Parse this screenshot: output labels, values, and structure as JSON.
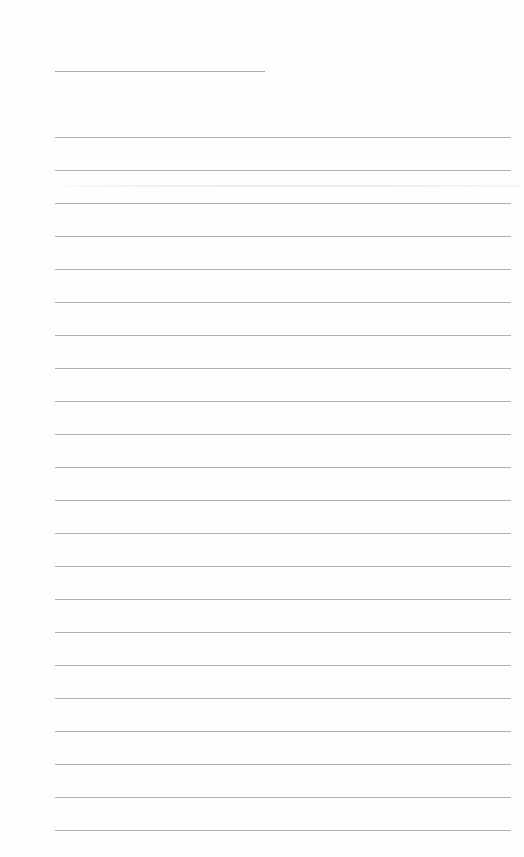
{
  "document": {
    "type": "blank ruled sheet",
    "title_line": {
      "x": 55,
      "y": 71,
      "width": 210
    },
    "ruled_lines": {
      "count": 22,
      "start_y": 137,
      "spacing": 33,
      "x_start": 55,
      "x_end": 511
    },
    "line_color": "#a6a6a6",
    "background_color": "#fefefe"
  }
}
